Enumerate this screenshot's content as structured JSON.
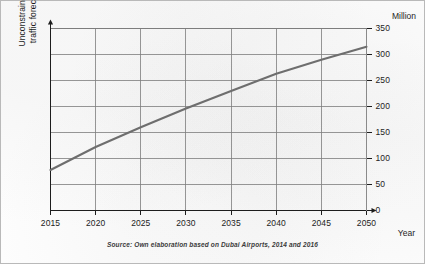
{
  "figure": {
    "unit_label": "Million",
    "x_axis_title": "Year",
    "y_axis_title_line1": "Unconstrained passenger",
    "y_axis_title_line2": "traffic forecast (millions)",
    "source_note": "Source: Own elaboration based on Dubai Airports, 2014 and 2016",
    "line_color": "#6e6e6e",
    "grid_color": "#7d7d7d",
    "axis_color": "#1d1d1d",
    "frame_color": "#b9b9b9"
  },
  "chart_data": {
    "type": "line",
    "title": "",
    "subtitle": "",
    "xlabel": "Year",
    "ylabel": "Unconstrained passenger traffic forecast (millions)",
    "unit": "Million",
    "x": [
      2015,
      2020,
      2025,
      2030,
      2035,
      2040,
      2045,
      2050
    ],
    "xticklabels": [
      "2015",
      "2020",
      "2025",
      "2030",
      "2035",
      "2040",
      "2045",
      "2050"
    ],
    "yticks": [
      0,
      50,
      100,
      150,
      200,
      250,
      300,
      350
    ],
    "yticklabels": [
      "0",
      "50",
      "100",
      "150",
      "200",
      "250",
      "300",
      "350"
    ],
    "xlim": [
      2015,
      2050
    ],
    "ylim": [
      0,
      350
    ],
    "grid": true,
    "legend": false,
    "series": [
      {
        "name": "Unconstrained passenger traffic forecast",
        "color": "#6e6e6e",
        "values": [
          78,
          122,
          160,
          196,
          230,
          263,
          290,
          315
        ]
      }
    ],
    "annotations": [
      "Source: Own elaboration based on Dubai Airports, 2014 and 2016"
    ]
  }
}
